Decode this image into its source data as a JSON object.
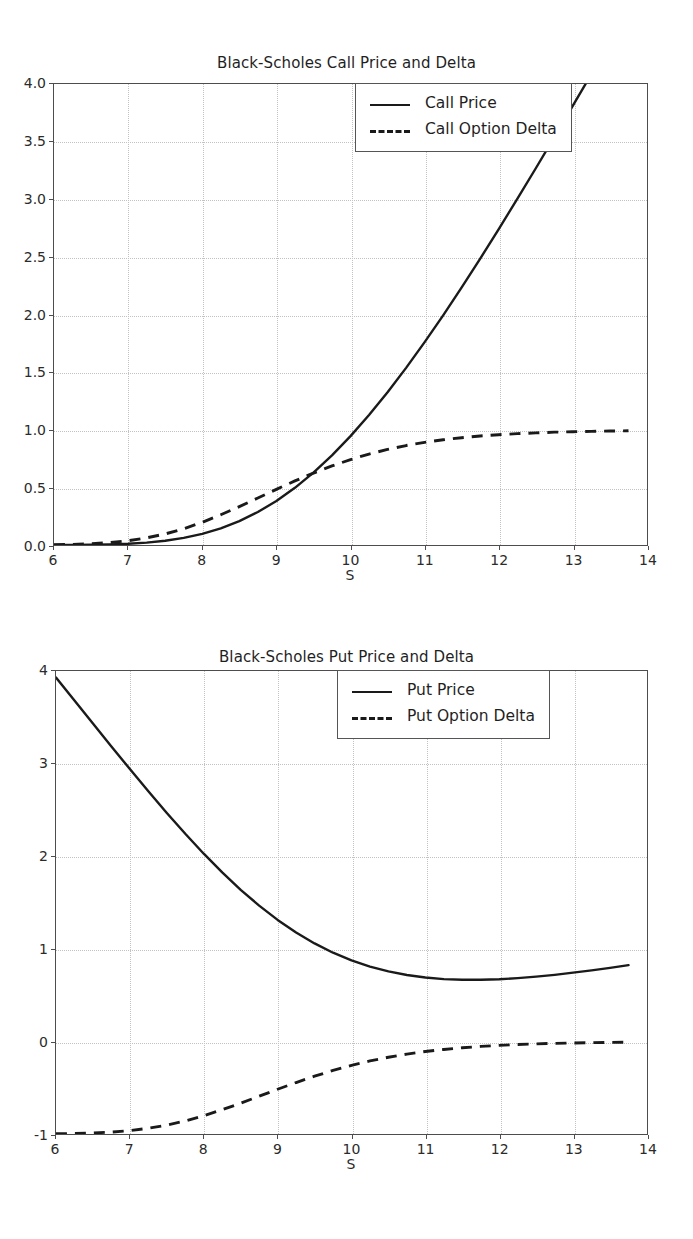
{
  "figure": {
    "background_color": "#ffffff",
    "line_color": "#1a1a1a",
    "grid_color": "#c2c2c2",
    "axis_color": "#4d4d4d"
  },
  "chart_data": [
    {
      "type": "line",
      "title": "Black-Scholes Call Price and Delta",
      "xlabel": "S",
      "ylabel": "",
      "xlim": [
        6,
        14
      ],
      "ylim": [
        0.0,
        4.0
      ],
      "grid": true,
      "legend_position": "upper right",
      "xticks": [
        "6",
        "7",
        "8",
        "9",
        "10",
        "11",
        "12",
        "13",
        "14"
      ],
      "yticks": [
        "0.0",
        "0.5",
        "1.0",
        "1.5",
        "2.0",
        "2.5",
        "3.0",
        "3.5",
        "4.0"
      ],
      "x": [
        6.0,
        6.25,
        6.5,
        6.75,
        7.0,
        7.25,
        7.5,
        7.75,
        8.0,
        8.25,
        8.5,
        8.75,
        9.0,
        9.25,
        9.5,
        9.75,
        10.0,
        10.25,
        10.5,
        10.75,
        11.0,
        11.25,
        11.5,
        11.75,
        12.0,
        12.25,
        12.5,
        12.75,
        13.0,
        13.25,
        13.5,
        13.75
      ],
      "series": [
        {
          "name": "Call Price",
          "style": "solid",
          "values": [
            0.0,
            0.001,
            0.002,
            0.005,
            0.011,
            0.021,
            0.037,
            0.062,
            0.097,
            0.145,
            0.207,
            0.286,
            0.382,
            0.496,
            0.628,
            0.778,
            0.945,
            1.128,
            1.326,
            1.537,
            1.76,
            1.993,
            2.235,
            2.485,
            2.741,
            3.003,
            3.269,
            3.539,
            3.812,
            4.087,
            4.364,
            4.643
          ]
        },
        {
          "name": "Call Option Delta",
          "style": "dashed",
          "values": [
            0.002,
            0.005,
            0.011,
            0.021,
            0.037,
            0.062,
            0.096,
            0.141,
            0.197,
            0.262,
            0.333,
            0.408,
            0.483,
            0.556,
            0.624,
            0.686,
            0.741,
            0.789,
            0.829,
            0.863,
            0.891,
            0.913,
            0.931,
            0.946,
            0.957,
            0.966,
            0.973,
            0.979,
            0.983,
            0.986,
            0.989,
            0.991
          ]
        }
      ]
    },
    {
      "type": "line",
      "title": "Black-Scholes Put Price and Delta",
      "xlabel": "S",
      "ylabel": "",
      "xlim": [
        6,
        14
      ],
      "ylim": [
        -1,
        4
      ],
      "grid": true,
      "legend_position": "upper right",
      "xticks": [
        "6",
        "7",
        "8",
        "9",
        "10",
        "11",
        "12",
        "13",
        "14"
      ],
      "yticks": [
        "-1",
        "0",
        "1",
        "2",
        "3",
        "4"
      ],
      "x": [
        6.0,
        6.25,
        6.5,
        6.75,
        7.0,
        7.25,
        7.5,
        7.75,
        8.0,
        8.25,
        8.5,
        8.75,
        9.0,
        9.25,
        9.5,
        9.75,
        10.0,
        10.25,
        10.5,
        10.75,
        11.0,
        11.25,
        11.5,
        11.75,
        12.0,
        12.25,
        12.5,
        12.75,
        13.0,
        13.25,
        13.5,
        13.75
      ],
      "series": [
        {
          "name": "Put Price",
          "style": "solid",
          "values": [
            3.93,
            3.681,
            3.432,
            3.185,
            2.941,
            2.701,
            2.467,
            2.242,
            2.027,
            1.825,
            1.637,
            1.466,
            1.312,
            1.176,
            1.058,
            0.958,
            0.875,
            0.808,
            0.756,
            0.717,
            0.69,
            0.673,
            0.665,
            0.665,
            0.671,
            0.683,
            0.699,
            0.719,
            0.742,
            0.767,
            0.794,
            0.823
          ]
        },
        {
          "name": "Put Option Delta",
          "style": "dashed",
          "values": [
            -0.998,
            -0.995,
            -0.989,
            -0.979,
            -0.963,
            -0.938,
            -0.904,
            -0.859,
            -0.803,
            -0.738,
            -0.667,
            -0.592,
            -0.517,
            -0.444,
            -0.376,
            -0.314,
            -0.259,
            -0.211,
            -0.171,
            -0.137,
            -0.109,
            -0.087,
            -0.069,
            -0.054,
            -0.043,
            -0.034,
            -0.027,
            -0.021,
            -0.017,
            -0.014,
            -0.011,
            -0.009
          ]
        }
      ]
    }
  ],
  "charts": {
    "call": {
      "title": "Black-Scholes Call Price and Delta",
      "xlabel": "S",
      "xticks": [
        "6",
        "7",
        "8",
        "9",
        "10",
        "11",
        "12",
        "13",
        "14"
      ],
      "yticks": [
        "4.0",
        "3.5",
        "3.0",
        "2.5",
        "2.0",
        "1.5",
        "1.0",
        "0.5",
        "0.0"
      ],
      "legend": [
        {
          "label": "Call Price",
          "style": "solid"
        },
        {
          "label": "Call Option Delta",
          "style": "dashed"
        }
      ]
    },
    "put": {
      "title": "Black-Scholes Put Price and Delta",
      "xlabel": "S",
      "xticks": [
        "6",
        "7",
        "8",
        "9",
        "10",
        "11",
        "12",
        "13",
        "14"
      ],
      "yticks": [
        "4",
        "3",
        "2",
        "1",
        "0",
        "-1"
      ],
      "legend": [
        {
          "label": "Put Price",
          "style": "solid"
        },
        {
          "label": "Put Option Delta",
          "style": "dashed"
        }
      ]
    }
  }
}
